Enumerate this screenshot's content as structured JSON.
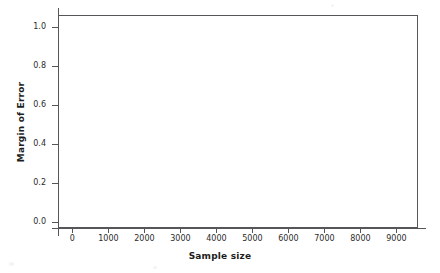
{
  "chart_data": {
    "type": "scatter",
    "title": "",
    "subtitle": "",
    "xlabel": "Sample size",
    "ylabel": "Margin of Error",
    "xlim": [
      -400,
      9600
    ],
    "ylim": [
      -0.03,
      1.06
    ],
    "xticks": [
      0,
      1000,
      2000,
      3000,
      4000,
      5000,
      6000,
      7000,
      8000,
      9000
    ],
    "xtick_labels": [
      "0",
      "1000",
      "2000",
      "3000",
      "4000",
      "5000",
      "6000",
      "7000",
      "8000",
      "9000"
    ],
    "yticks": [
      0.0,
      0.2,
      0.4,
      0.6,
      0.8,
      1.0
    ],
    "ytick_labels": [
      "0.0",
      "0.2",
      "0.4",
      "0.6",
      "0.8",
      "1.0"
    ],
    "grid": false,
    "legend": null,
    "legend_position": "none",
    "annotations": [],
    "series": [
      {
        "name": "",
        "x": [],
        "y": []
      }
    ],
    "x": [],
    "values": [],
    "categories": []
  },
  "style": {
    "frame_color": "#55565a",
    "text_color": "#2b2b2b",
    "title_color": "#1d1d1d",
    "plot_background": "#ffffff",
    "page_background": "#ffffff"
  }
}
